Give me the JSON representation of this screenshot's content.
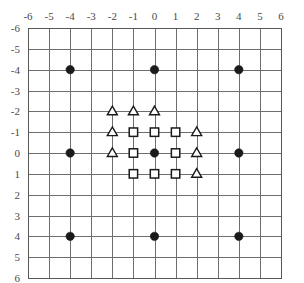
{
  "chart_data": {
    "type": "scatter",
    "title": "",
    "xlabel": "",
    "ylabel": "",
    "xlim": [
      -6,
      6
    ],
    "ylim": [
      -6,
      6
    ],
    "y_axis_inverted": true,
    "grid": true,
    "grid_step": 1,
    "legend_position": "none",
    "x_ticks": [
      "-6",
      "-5",
      "-4",
      "-3",
      "-2",
      "-1",
      "0",
      "1",
      "2",
      "3",
      "4",
      "5",
      "6"
    ],
    "y_ticks": [
      "-6",
      "-5",
      "-4",
      "-3",
      "-2",
      "-1",
      "0",
      "1",
      "2",
      "3",
      "4",
      "5",
      "6"
    ],
    "x_tick_values": [
      -6,
      -5,
      -4,
      -3,
      -2,
      -1,
      0,
      1,
      2,
      3,
      4,
      5,
      6
    ],
    "y_tick_values": [
      -6,
      -5,
      -4,
      -3,
      -2,
      -1,
      0,
      1,
      2,
      3,
      4,
      5,
      6
    ],
    "series": [
      {
        "name": "filled-circle",
        "marker": "circle",
        "fill": "#1a1a1a",
        "stroke": "#1a1a1a",
        "points": [
          [
            -4,
            -4
          ],
          [
            0,
            -4
          ],
          [
            4,
            -4
          ],
          [
            -4,
            0
          ],
          [
            0,
            0
          ],
          [
            4,
            0
          ],
          [
            -4,
            4
          ],
          [
            0,
            4
          ],
          [
            4,
            4
          ]
        ]
      },
      {
        "name": "open-square",
        "marker": "square",
        "fill": "#ffffff",
        "stroke": "#1a1a1a",
        "points": [
          [
            -1,
            -1
          ],
          [
            0,
            -1
          ],
          [
            1,
            -1
          ],
          [
            -1,
            0
          ],
          [
            1,
            0
          ],
          [
            -1,
            1
          ],
          [
            0,
            1
          ],
          [
            1,
            1
          ]
        ]
      },
      {
        "name": "open-triangle",
        "marker": "triangle",
        "fill": "#ffffff",
        "stroke": "#1a1a1a",
        "points": [
          [
            -2,
            -2
          ],
          [
            -1,
            -2
          ],
          [
            0,
            -2
          ],
          [
            -2,
            -1
          ],
          [
            2,
            -1
          ],
          [
            -2,
            0
          ],
          [
            2,
            0
          ],
          [
            2,
            1
          ]
        ]
      }
    ]
  },
  "figure": {
    "background": "#ffffff",
    "grid_color": "#6e6e6e",
    "frame_color": "#585858",
    "label_color": "#4a4a4a"
  },
  "layout": {
    "plot_left": 28,
    "plot_top": 28,
    "plot_width": 253,
    "plot_height": 250
  }
}
